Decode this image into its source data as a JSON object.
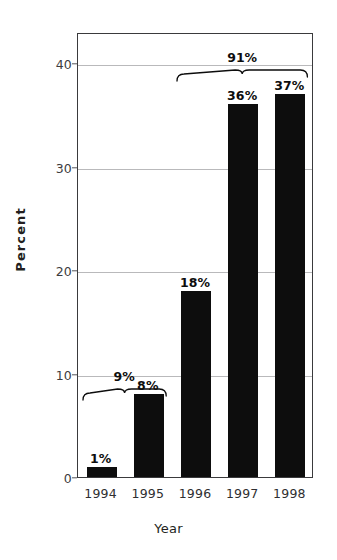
{
  "chart_data": {
    "type": "bar",
    "title": "",
    "subtitle": "",
    "xlabel": "Year",
    "ylabel": "Percent",
    "categories": [
      "1994",
      "1995",
      "1996",
      "1997",
      "1998"
    ],
    "values": [
      1,
      8,
      18,
      36,
      37
    ],
    "value_labels": [
      "1%",
      "8%",
      "18%",
      "36%",
      "37%"
    ],
    "series": [
      {
        "name": "Percent",
        "values": [
          1,
          8,
          18,
          36,
          37
        ]
      }
    ],
    "ylim": [
      0,
      43
    ],
    "yticks": [
      0,
      10,
      20,
      30,
      40
    ],
    "ytick_labels": [
      "0",
      "10",
      "20",
      "30",
      "40"
    ],
    "xlim_categories": [
      "1994",
      "1998"
    ],
    "grid": "horizontal",
    "legend": "none",
    "bar_color": "#0d0d0d",
    "gridline_color": "#b9b9bb",
    "frame_color": "#3a3a3c",
    "background": "#ffffff",
    "annotations": [
      {
        "id": "bracket-1994-1995",
        "label": "9%",
        "spans": [
          "1994",
          "1995"
        ],
        "value": 9,
        "type": "brace"
      },
      {
        "id": "bracket-1996-1998",
        "label": "91%",
        "spans": [
          "1996",
          "1997",
          "1998"
        ],
        "value": 91,
        "type": "brace"
      }
    ]
  }
}
